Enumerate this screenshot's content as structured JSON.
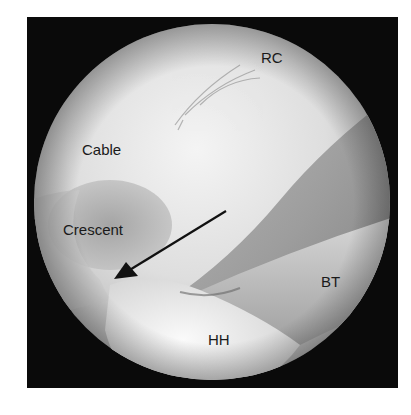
{
  "figure": {
    "labels": [
      {
        "id": "rc",
        "text": "RC",
        "x": 261,
        "y": 63
      },
      {
        "id": "cable",
        "text": "Cable",
        "x": 82,
        "y": 155
      },
      {
        "id": "crescent",
        "text": "Crescent",
        "x": 63,
        "y": 235
      },
      {
        "id": "bt",
        "text": "BT",
        "x": 321,
        "y": 287
      },
      {
        "id": "hh",
        "text": "HH",
        "x": 208,
        "y": 345
      }
    ],
    "arrow": {
      "from": [
        226,
        211
      ],
      "to": [
        114,
        279
      ],
      "color": "#111111"
    },
    "colors": {
      "frame": "#0a0a0a",
      "background": "#ffffff"
    }
  }
}
